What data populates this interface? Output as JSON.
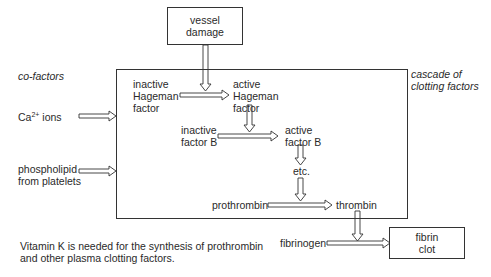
{
  "diagram": {
    "nodes": {
      "vessel_damage": [
        "vessel",
        "damage"
      ],
      "cofactors_title": "co-factors",
      "cascade_title": [
        "cascade of",
        "clotting factors"
      ],
      "ca_ions": {
        "base": "Ca",
        "sup": "2+",
        "suffix": " ions"
      },
      "phospholipid": [
        "phospholipid",
        "from platelets"
      ],
      "inactive_hageman": [
        "inactive",
        "Hageman",
        "factor"
      ],
      "active_hageman": [
        "active",
        "Hageman",
        "factor"
      ],
      "inactive_factor_b": [
        "inactive",
        "factor B"
      ],
      "active_factor_b": [
        "active",
        "factor B"
      ],
      "etc": "etc.",
      "prothrombin": "prothrombin",
      "thrombin": "thrombin",
      "fibrinogen": "fibrinogen",
      "fibrin_clot": [
        "fibrin",
        "clot"
      ]
    },
    "note": [
      "Vitamin K is needed for the synthesis of prothrombin",
      "and other plasma clotting factors."
    ],
    "edges": [
      {
        "from": "vessel damage",
        "to": "inactive Hageman factor arrow"
      },
      {
        "from": "inactive Hageman factor",
        "to": "active Hageman factor"
      },
      {
        "from": "active Hageman factor",
        "to": "inactive factor B arrow"
      },
      {
        "from": "inactive factor B",
        "to": "active factor B"
      },
      {
        "from": "active factor B",
        "to": "etc."
      },
      {
        "from": "etc.",
        "to": "prothrombin arrow"
      },
      {
        "from": "prothrombin",
        "to": "thrombin"
      },
      {
        "from": "thrombin",
        "to": "fibrinogen arrow"
      },
      {
        "from": "fibrinogen",
        "to": "fibrin clot"
      },
      {
        "from": "Ca2+ ions",
        "to": "cascade of clotting factors"
      },
      {
        "from": "phospholipid from platelets",
        "to": "cascade of clotting factors"
      }
    ],
    "colors": {
      "line": "#333333",
      "text": "#2a2a2a",
      "background": "#ffffff"
    }
  }
}
